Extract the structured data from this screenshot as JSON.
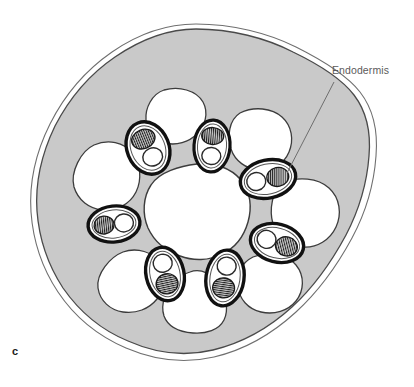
{
  "figure": {
    "panel_label": "c",
    "type": "botanical-cross-section-diagram",
    "background_color": "#ffffff"
  },
  "annotations": [
    {
      "name": "endodermis",
      "text": "Endodermis",
      "text_color": "#5b5b5b",
      "leader_line_color": "#6e6e6e",
      "leader_from": [
        334,
        82
      ],
      "leader_to": [
        287,
        173
      ]
    }
  ],
  "structures": {
    "epidermis": {
      "label": "epidermis-outline",
      "stroke": "#4a4a4a",
      "stroke_inner": "#8c8c8c",
      "fill": "none"
    },
    "cortex": {
      "label": "cortex-parenchyma",
      "fill": "#c9c9c9",
      "stroke": "#4a4a4a"
    },
    "central_cavity": {
      "label": "central-pith-cavity",
      "fill": "#ffffff",
      "stroke": "#3c3c3c"
    },
    "air_lacunae": {
      "label": "air-lacuna",
      "count": 8,
      "fill": "#ffffff",
      "stroke": "#3c3c3c"
    },
    "vascular_bundles": {
      "label": "vascular-bundle",
      "count": 8,
      "ring_stroke": "#111111",
      "sheath_fill": "#ffffff",
      "xylem_fill": "#c0c0c0",
      "xylem_hatch": "#1a1a1a",
      "phloem_fill": "#ffffff",
      "phloem_stroke": "#2a2a2a"
    }
  },
  "colors": {
    "cortex_gray": "#c9c9c9",
    "white": "#ffffff",
    "outline_dark": "#3c3c3c",
    "bundle_ring_black": "#111111",
    "label_gray": "#5b5b5b"
  }
}
